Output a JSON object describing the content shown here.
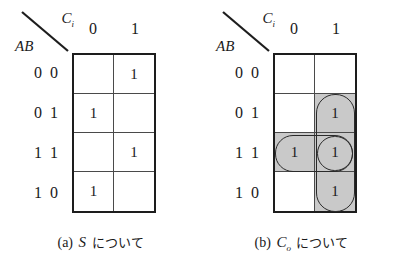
{
  "figure": {
    "panels": [
      {
        "id": "kmap-s",
        "corner": {
          "col_var": "C",
          "col_var_sub": "i",
          "row_var": "AB"
        },
        "column_headers": [
          "0",
          "1"
        ],
        "row_labels": [
          "0 0",
          "0 1",
          "1 1",
          "1 0"
        ],
        "cells": [
          [
            "",
            "1"
          ],
          [
            "1",
            ""
          ],
          [
            "",
            "1"
          ],
          [
            "1",
            ""
          ]
        ],
        "shaded": [
          [
            false,
            false
          ],
          [
            false,
            false
          ],
          [
            false,
            false
          ],
          [
            false,
            false
          ]
        ],
        "groups": [],
        "caption": {
          "tag": "(a)",
          "var": "S",
          "var_sub": "",
          "text": "について"
        }
      },
      {
        "id": "kmap-co",
        "corner": {
          "col_var": "C",
          "col_var_sub": "i",
          "row_var": "AB"
        },
        "column_headers": [
          "0",
          "1"
        ],
        "row_labels": [
          "0 0",
          "0 1",
          "1 1",
          "1 0"
        ],
        "cells": [
          [
            "",
            ""
          ],
          [
            "",
            "1"
          ],
          [
            "1",
            "1"
          ],
          [
            "",
            "1"
          ]
        ],
        "shaded": [
          [
            false,
            false
          ],
          [
            false,
            true
          ],
          [
            true,
            true
          ],
          [
            false,
            true
          ]
        ],
        "groups": [
          {
            "name": "group-vertical-ci-ab",
            "left": 43,
            "top": 41,
            "width": 39,
            "height": 118,
            "radius": 19
          },
          {
            "name": "group-horizontal-ab",
            "left": 2,
            "top": 82,
            "width": 78,
            "height": 37,
            "radius": 18
          },
          {
            "name": "group-cell-ac",
            "left": 44,
            "top": 83,
            "width": 36,
            "height": 35,
            "radius": 18
          }
        ],
        "caption": {
          "tag": "(b)",
          "var": "C",
          "var_sub": "o",
          "text": "について"
        }
      }
    ]
  },
  "colors": {
    "ink": "#1d1d1d",
    "grid_line": "#4a4a4a",
    "shade": "#c9c9c9",
    "background": "#ffffff"
  },
  "chart_data": {
    "type": "table",
    "maps": [
      {
        "output": "S",
        "row_variables": "AB",
        "col_variable": "Ci",
        "col_values": [
          "0",
          "1"
        ],
        "rows": [
          {
            "ab": "00",
            "values": [
              "",
              "1"
            ]
          },
          {
            "ab": "01",
            "values": [
              "1",
              ""
            ]
          },
          {
            "ab": "11",
            "values": [
              "",
              "1"
            ]
          },
          {
            "ab": "10",
            "values": [
              "1",
              ""
            ]
          }
        ],
        "minterms": [
          "001",
          "010",
          "111",
          "100"
        ],
        "groupings": 0
      },
      {
        "output": "Co",
        "row_variables": "AB",
        "col_variable": "Ci",
        "col_values": [
          "0",
          "1"
        ],
        "rows": [
          {
            "ab": "00",
            "values": [
              "",
              ""
            ]
          },
          {
            "ab": "01",
            "values": [
              "",
              "1"
            ]
          },
          {
            "ab": "11",
            "values": [
              "1",
              "1"
            ]
          },
          {
            "ab": "10",
            "values": [
              "",
              "1"
            ]
          }
        ],
        "minterms": [
          "011",
          "110",
          "111",
          "101"
        ],
        "groupings": 3
      }
    ]
  }
}
